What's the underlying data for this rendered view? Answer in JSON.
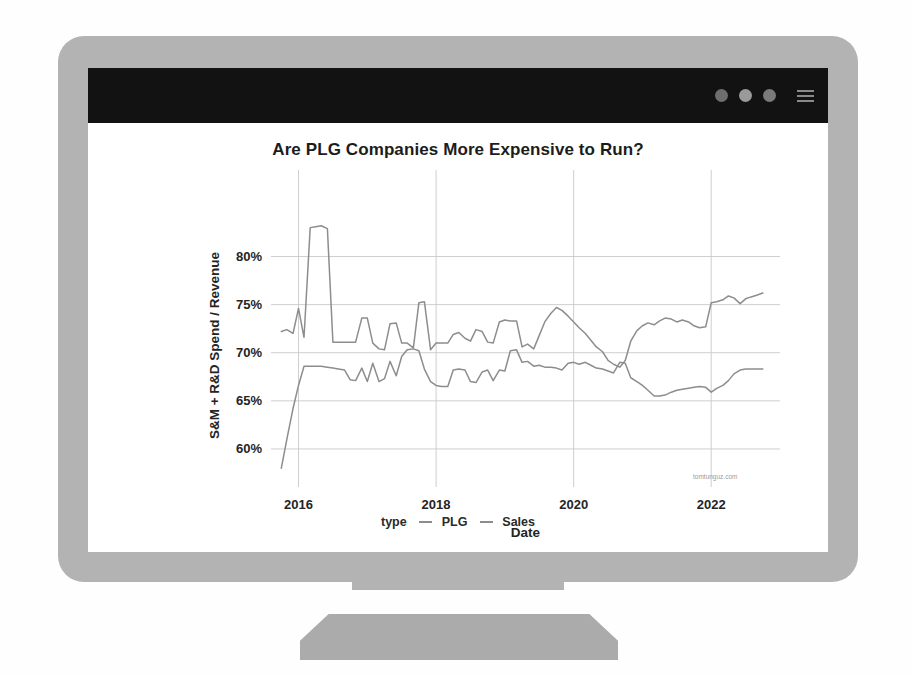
{
  "window": {
    "titlebar": {
      "dots": [
        "window-dot-1",
        "window-dot-2",
        "window-dot-3"
      ],
      "menu_icon": "hamburger-menu-icon"
    }
  },
  "chart_data": {
    "type": "line",
    "title": "Are PLG Companies More Expensive to Run?",
    "xlabel": "Date",
    "ylabel": "S&M + R&D Spend / Revenue",
    "legend_title": "type",
    "legend_position": "bottom",
    "grid": true,
    "watermark": "tomtunguz.com",
    "xlim": [
      2015.6,
      2023.0
    ],
    "ylim": [
      57.5,
      84.0
    ],
    "xticks": [
      "2016",
      "2018",
      "2020",
      "2022"
    ],
    "xtick_values": [
      2016,
      2018,
      2020,
      2022
    ],
    "yticks": [
      "60%",
      "65%",
      "70%",
      "75%",
      "80%"
    ],
    "ytick_values": [
      60,
      65,
      70,
      75,
      80
    ],
    "color": "#8d8d8d",
    "series": [
      {
        "name": "PLG",
        "color": "#8d8d8d",
        "x": [
          2015.75,
          2015.83,
          2015.92,
          2016.0,
          2016.08,
          2016.17,
          2016.25,
          2016.33,
          2016.42,
          2016.5,
          2016.58,
          2016.67,
          2016.75,
          2016.83,
          2016.92,
          2017.0,
          2017.08,
          2017.17,
          2017.25,
          2017.33,
          2017.42,
          2017.5,
          2017.58,
          2017.67,
          2017.75,
          2017.83,
          2017.92,
          2018.0,
          2018.08,
          2018.17,
          2018.25,
          2018.33,
          2018.42,
          2018.5,
          2018.58,
          2018.67,
          2018.75,
          2018.83,
          2018.92,
          2019.0,
          2019.08,
          2019.17,
          2019.25,
          2019.33,
          2019.42,
          2019.5,
          2019.58,
          2019.67,
          2019.75,
          2019.83,
          2019.92,
          2020.0,
          2020.08,
          2020.17,
          2020.25,
          2020.33,
          2020.42,
          2020.5,
          2020.58,
          2020.67,
          2020.75,
          2020.83,
          2020.92,
          2021.0,
          2021.08,
          2021.17,
          2021.25,
          2021.33,
          2021.42,
          2021.5,
          2021.58,
          2021.67,
          2021.75,
          2021.83,
          2021.92,
          2022.0,
          2022.08,
          2022.17,
          2022.25,
          2022.33,
          2022.42,
          2022.5,
          2022.58,
          2022.67,
          2022.75
        ],
        "y": [
          72.2,
          72.4,
          72.0,
          74.6,
          71.6,
          83.0,
          83.1,
          83.2,
          82.9,
          71.1,
          71.1,
          71.1,
          71.1,
          71.1,
          73.6,
          73.6,
          71.0,
          70.4,
          70.3,
          73.0,
          73.1,
          71.0,
          71.0,
          70.5,
          75.2,
          75.3,
          70.3,
          71.0,
          71.0,
          71.0,
          71.9,
          72.1,
          71.5,
          71.2,
          72.4,
          72.2,
          71.1,
          71.0,
          73.2,
          73.4,
          73.3,
          73.3,
          70.6,
          70.9,
          70.4,
          71.8,
          73.2,
          74.1,
          74.7,
          74.4,
          73.8,
          73.2,
          72.6,
          72.0,
          71.3,
          70.6,
          70.1,
          69.2,
          68.8,
          68.5,
          69.2,
          71.2,
          72.3,
          72.8,
          73.1,
          72.9,
          73.3,
          73.6,
          73.5,
          73.2,
          73.4,
          73.2,
          72.8,
          72.6,
          72.7,
          75.2,
          75.3,
          75.5,
          75.9,
          75.7,
          75.1,
          75.6,
          75.8,
          76.0,
          76.2
        ]
      },
      {
        "name": "Sales",
        "color": "#8d8d8d",
        "x": [
          2015.75,
          2015.83,
          2015.92,
          2016.0,
          2016.08,
          2016.17,
          2016.25,
          2016.33,
          2016.42,
          2016.5,
          2016.58,
          2016.67,
          2016.75,
          2016.83,
          2016.92,
          2017.0,
          2017.08,
          2017.17,
          2017.25,
          2017.33,
          2017.42,
          2017.5,
          2017.58,
          2017.67,
          2017.75,
          2017.83,
          2017.92,
          2018.0,
          2018.08,
          2018.17,
          2018.25,
          2018.33,
          2018.42,
          2018.5,
          2018.58,
          2018.67,
          2018.75,
          2018.83,
          2018.92,
          2019.0,
          2019.08,
          2019.17,
          2019.25,
          2019.33,
          2019.42,
          2019.5,
          2019.58,
          2019.67,
          2019.75,
          2019.83,
          2019.92,
          2020.0,
          2020.08,
          2020.17,
          2020.25,
          2020.33,
          2020.42,
          2020.5,
          2020.58,
          2020.67,
          2020.75,
          2020.83,
          2020.92,
          2021.0,
          2021.08,
          2021.17,
          2021.25,
          2021.33,
          2021.42,
          2021.5,
          2021.58,
          2021.67,
          2021.75,
          2021.83,
          2021.92,
          2022.0,
          2022.08,
          2022.17,
          2022.25,
          2022.33,
          2022.42,
          2022.5,
          2022.58,
          2022.67,
          2022.75
        ],
        "y": [
          58.0,
          61.0,
          64.2,
          66.6,
          68.6,
          68.6,
          68.6,
          68.6,
          68.5,
          68.4,
          68.3,
          68.2,
          67.2,
          67.1,
          68.4,
          67.0,
          68.9,
          67.0,
          67.3,
          69.1,
          67.6,
          69.6,
          70.3,
          70.4,
          70.2,
          68.3,
          67.0,
          66.6,
          66.5,
          66.5,
          68.2,
          68.3,
          68.2,
          67.0,
          66.9,
          68.0,
          68.2,
          67.1,
          68.2,
          68.1,
          70.2,
          70.3,
          69.0,
          69.1,
          68.6,
          68.7,
          68.5,
          68.5,
          68.4,
          68.2,
          68.9,
          69.0,
          68.8,
          69.0,
          68.7,
          68.4,
          68.3,
          68.1,
          67.9,
          69.0,
          68.9,
          67.4,
          67.0,
          66.6,
          66.1,
          65.5,
          65.5,
          65.6,
          65.9,
          66.1,
          66.2,
          66.3,
          66.4,
          66.5,
          66.4,
          65.9,
          66.3,
          66.6,
          67.1,
          67.8,
          68.2,
          68.3,
          68.3,
          68.3,
          68.3
        ]
      }
    ]
  }
}
